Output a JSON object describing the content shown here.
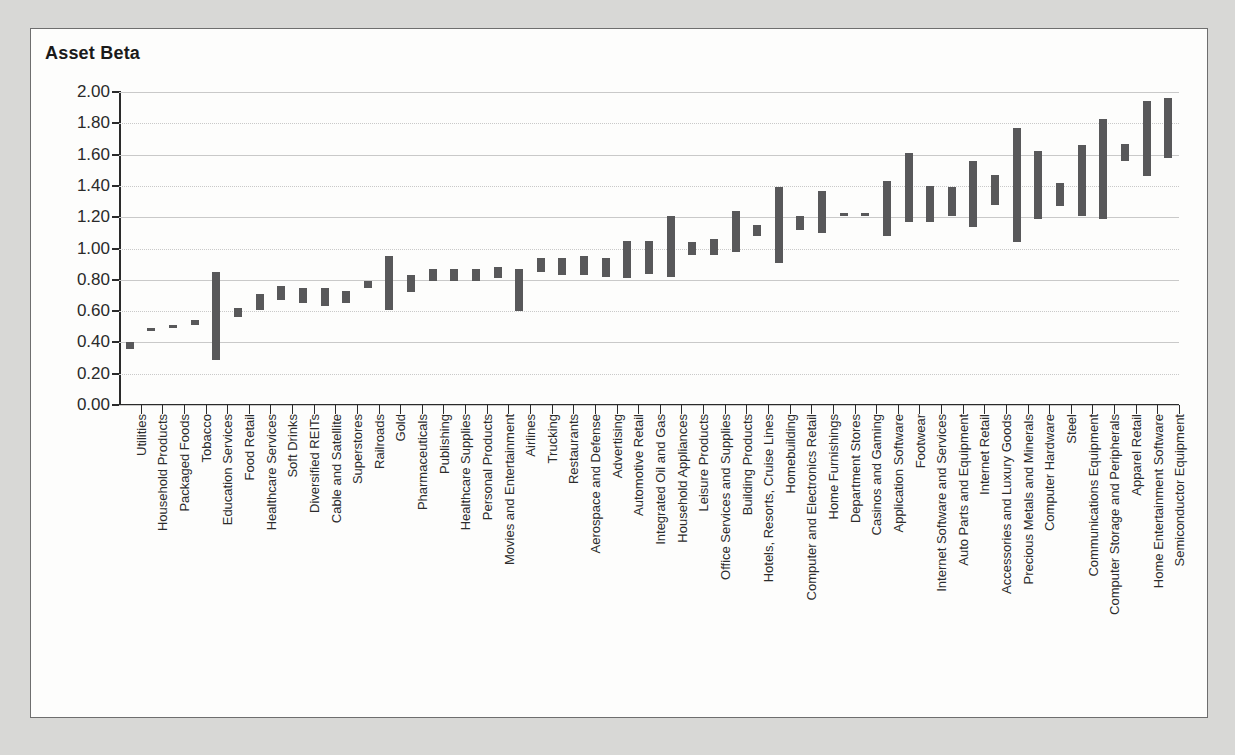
{
  "chart_title": "Asset Beta",
  "chart_data": {
    "type": "bar",
    "subtype": "floating-range-bar",
    "title": "Asset Beta",
    "xlabel": "",
    "ylabel": "Asset Beta",
    "ylim": [
      0.0,
      2.0
    ],
    "ytick_labels": [
      "0.00",
      "0.20",
      "0.40",
      "0.60",
      "0.80",
      "1.00",
      "1.20",
      "1.40",
      "1.60",
      "1.80",
      "2.00"
    ],
    "ytick_values": [
      0.0,
      0.2,
      0.4,
      0.6,
      0.8,
      1.0,
      1.2,
      1.4,
      1.6,
      1.8,
      2.0
    ],
    "grid": true,
    "legend": "none",
    "bar_color": "#58585a",
    "categories": [
      "Utilities",
      "Household Products",
      "Packaged Foods",
      "Tobacco",
      "Education Services",
      "Food Retail",
      "Healthcare Services",
      "Soft Drinks",
      "Diversified REITs",
      "Cable and Satellite",
      "Superstores",
      "Railroads",
      "Gold",
      "Pharmaceuticals",
      "Publishing",
      "Healthcare Supplies",
      "Personal Products",
      "Movies and Entertainment",
      "Airlines",
      "Trucking",
      "Restaurants",
      "Aerospace and Defense",
      "Advertising",
      "Automotive Retail",
      "Integrated Oil and Gas",
      "Household Appliances",
      "Leisure Products",
      "Office Services and Supplies",
      "Building Products",
      "Hotels, Resorts, Cruise Lines",
      "Homebuilding",
      "Computer and Electronics Retail",
      "Home Furnishings",
      "Department Stores",
      "Casinos and Gaming",
      "Application Software",
      "Footwear",
      "Internet Software and Services",
      "Auto Parts and Equipment",
      "Internet Retail",
      "Accessories and Luxury Goods",
      "Precious Metals and Minerals",
      "Computer Hardware",
      "Steel",
      "Communications Equipment",
      "Computer Storage and Peripherals",
      "Apparel Retail",
      "Home Entertainment Software",
      "Semiconductor Equipment"
    ],
    "ranges": [
      [
        0.36,
        0.4
      ],
      [
        0.48,
        0.49
      ],
      [
        0.5,
        0.51
      ],
      [
        0.51,
        0.54
      ],
      [
        0.29,
        0.85
      ],
      [
        0.56,
        0.62
      ],
      [
        0.61,
        0.71
      ],
      [
        0.67,
        0.76
      ],
      [
        0.65,
        0.75
      ],
      [
        0.63,
        0.75
      ],
      [
        0.65,
        0.73
      ],
      [
        0.75,
        0.79
      ],
      [
        0.61,
        0.95
      ],
      [
        0.72,
        0.83
      ],
      [
        0.79,
        0.87
      ],
      [
        0.79,
        0.87
      ],
      [
        0.79,
        0.87
      ],
      [
        0.81,
        0.88
      ],
      [
        0.6,
        0.87
      ],
      [
        0.85,
        0.94
      ],
      [
        0.83,
        0.94
      ],
      [
        0.83,
        0.95
      ],
      [
        0.82,
        0.94
      ],
      [
        0.81,
        1.05
      ],
      [
        0.84,
        1.05
      ],
      [
        0.82,
        1.21
      ],
      [
        0.96,
        1.04
      ],
      [
        0.96,
        1.06
      ],
      [
        0.98,
        1.24
      ],
      [
        1.08,
        1.15
      ],
      [
        0.91,
        1.39
      ],
      [
        1.12,
        1.21
      ],
      [
        1.1,
        1.37
      ],
      [
        1.21,
        1.23
      ],
      [
        1.21,
        1.23
      ],
      [
        1.08,
        1.43
      ],
      [
        1.17,
        1.61
      ],
      [
        1.17,
        1.4
      ],
      [
        1.21,
        1.39
      ],
      [
        1.14,
        1.56
      ],
      [
        1.28,
        1.47
      ],
      [
        1.04,
        1.77
      ],
      [
        1.19,
        1.62
      ],
      [
        1.27,
        1.42
      ],
      [
        1.21,
        1.66
      ],
      [
        1.19,
        1.83
      ],
      [
        1.56,
        1.67
      ],
      [
        1.46,
        1.94
      ],
      [
        1.58,
        1.96
      ]
    ]
  }
}
